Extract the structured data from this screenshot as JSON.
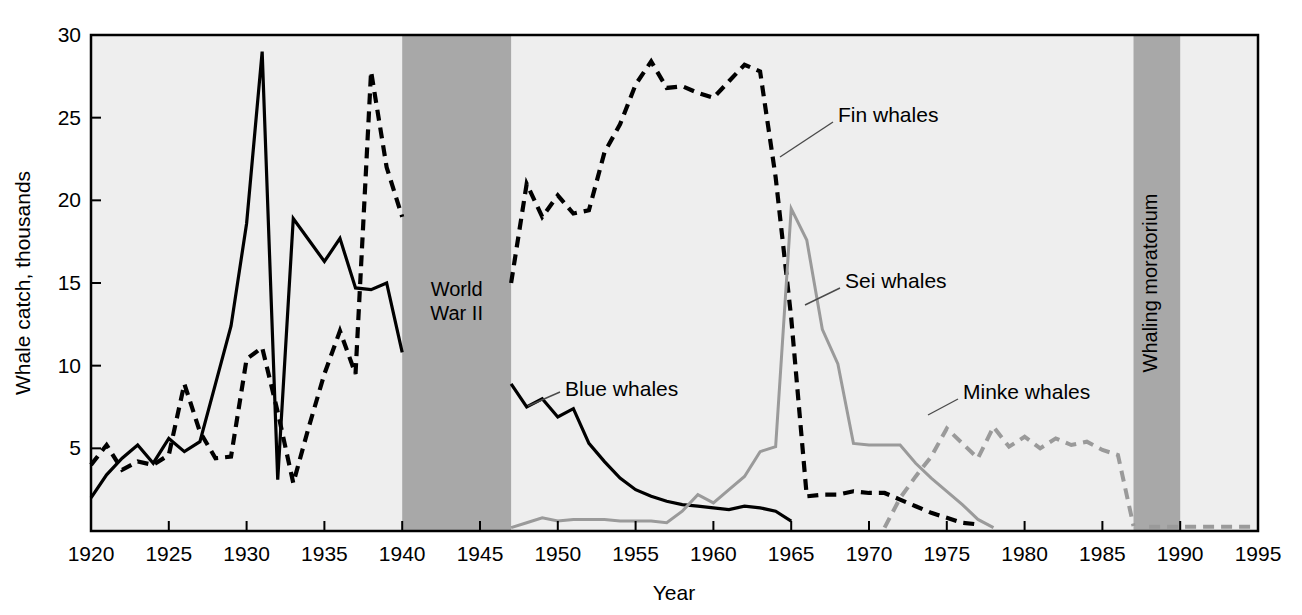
{
  "chart_data": {
    "type": "line",
    "title": "",
    "xlabel": "Year",
    "ylabel": "Whale catch, thousands",
    "xlim": [
      1920,
      1995
    ],
    "ylim": [
      0,
      30
    ],
    "grid": false,
    "legend_position": "inline-annotations",
    "xticks": [
      1920,
      1925,
      1930,
      1935,
      1940,
      1945,
      1950,
      1955,
      1960,
      1965,
      1970,
      1975,
      1980,
      1985,
      1990,
      1995
    ],
    "xtick_labels": [
      "1920",
      "1925",
      "1930",
      "1935",
      "1940",
      "1945",
      "1950",
      "1955",
      "1960",
      "1965",
      "1970",
      "1975",
      "1980",
      "1985",
      "1990",
      "1995"
    ],
    "yticks": [
      5,
      10,
      15,
      20,
      25,
      30
    ],
    "ytick_labels": [
      "5",
      "10",
      "15",
      "20",
      "25",
      "30"
    ],
    "plot_background": "#eeeeee",
    "bands": [
      {
        "name": "world-war-ii",
        "label": "World\nWar II",
        "label_line1": "World",
        "label_line2": "War II",
        "x_start": 1940,
        "x_end": 1947,
        "color": "#a8a8a8",
        "orientation": "horizontal-text"
      },
      {
        "name": "whaling-moratorium",
        "label": "Whaling moratorium",
        "x_start": 1987,
        "x_end": 1990,
        "color": "#a8a8a8",
        "orientation": "vertical-text"
      }
    ],
    "series": [
      {
        "name": "Blue whales",
        "label": "Blue whales",
        "color": "#000000",
        "style": "solid",
        "width": 3.2,
        "label_x": 565,
        "label_y": 396,
        "leader": [
          [
            560,
            392
          ],
          [
            528,
            406
          ]
        ],
        "segments": [
          {
            "x": [
              1920,
              1921,
              1922,
              1923,
              1924,
              1925,
              1926,
              1927,
              1928,
              1929,
              1930,
              1931,
              1932,
              1933,
              1934,
              1935,
              1936,
              1937,
              1938,
              1939,
              1940
            ],
            "y": [
              2.0,
              3.4,
              4.4,
              5.2,
              4.1,
              5.6,
              4.8,
              5.4,
              8.9,
              12.4,
              18.6,
              29.0,
              3.1,
              18.9,
              17.6,
              16.3,
              17.7,
              14.7,
              14.6,
              15.0,
              10.8
            ]
          },
          {
            "x": [
              1947,
              1948,
              1949,
              1950,
              1951,
              1952,
              1953,
              1954,
              1955,
              1956,
              1957,
              1958,
              1959,
              1960,
              1961,
              1962,
              1963,
              1964,
              1965
            ],
            "y": [
              8.9,
              7.5,
              8.0,
              6.9,
              7.4,
              5.3,
              4.2,
              3.2,
              2.5,
              2.1,
              1.8,
              1.6,
              1.5,
              1.4,
              1.3,
              1.5,
              1.4,
              1.2,
              0.6
            ]
          }
        ]
      },
      {
        "name": "Fin whales",
        "label": "Fin whales",
        "color": "#000000",
        "style": "dashed",
        "width": 4.2,
        "label_x": 838,
        "label_y": 122,
        "leader": [
          [
            833,
            122
          ],
          [
            780,
            157
          ]
        ],
        "segments": [
          {
            "x": [
              1920,
              1921,
              1922,
              1923,
              1924,
              1925,
              1926,
              1927,
              1928,
              1929,
              1930,
              1931,
              1932,
              1933,
              1934,
              1935,
              1936,
              1937,
              1938,
              1939,
              1940
            ],
            "y": [
              4.0,
              5.2,
              3.7,
              4.2,
              4.0,
              4.6,
              8.9,
              6.0,
              4.4,
              4.5,
              10.4,
              11.1,
              7.2,
              2.9,
              6.3,
              9.5,
              12.1,
              9.5,
              27.8,
              22.0,
              19.0
            ]
          },
          {
            "x": [
              1947,
              1948,
              1949,
              1950,
              1951,
              1952,
              1953,
              1954,
              1955,
              1956,
              1957,
              1958,
              1959,
              1960,
              1961,
              1962,
              1963,
              1964,
              1965,
              1966,
              1967,
              1968,
              1969,
              1970,
              1971,
              1972,
              1973,
              1974,
              1975,
              1976,
              1977
            ],
            "y": [
              15.0,
              21.0,
              19.0,
              20.3,
              19.2,
              19.4,
              22.9,
              24.6,
              27.0,
              28.4,
              26.8,
              26.9,
              26.5,
              26.2,
              27.2,
              28.2,
              27.8,
              21.4,
              12.9,
              2.1,
              2.2,
              2.2,
              2.4,
              2.3,
              2.3,
              1.9,
              1.5,
              1.1,
              0.8,
              0.5,
              0.4
            ]
          }
        ]
      },
      {
        "name": "Sei whales",
        "label": "Sei whales",
        "color": "#9a9a9a",
        "style": "solid",
        "width": 3.0,
        "label_x": 845,
        "label_y": 288,
        "leader": [
          [
            840,
            288
          ],
          [
            805,
            305
          ]
        ],
        "segments": [
          {
            "x": [
              1947,
              1948,
              1949,
              1950,
              1951,
              1952,
              1953,
              1954,
              1955,
              1956,
              1957,
              1958,
              1959,
              1960,
              1961,
              1962,
              1963,
              1964,
              1965,
              1966,
              1967,
              1968,
              1969,
              1970,
              1971,
              1972,
              1973,
              1974,
              1975,
              1976,
              1977,
              1978
            ],
            "y": [
              0.2,
              0.5,
              0.8,
              0.6,
              0.7,
              0.7,
              0.7,
              0.6,
              0.6,
              0.6,
              0.5,
              1.2,
              2.2,
              1.7,
              2.5,
              3.3,
              4.8,
              5.1,
              19.5,
              17.6,
              12.2,
              10.1,
              5.3,
              5.2,
              5.2,
              5.2,
              4.1,
              3.2,
              2.4,
              1.6,
              0.7,
              0.2
            ]
          }
        ]
      },
      {
        "name": "Minke whales",
        "label": "Minke whales",
        "color": "#9a9a9a",
        "style": "dashed",
        "width": 4.0,
        "label_x": 963,
        "label_y": 399,
        "leader": [
          [
            958,
            399
          ],
          [
            928,
            415
          ]
        ],
        "segments": [
          {
            "x": [
              1971,
              1972,
              1973,
              1974,
              1975,
              1976,
              1977,
              1978,
              1979,
              1980,
              1981,
              1982,
              1983,
              1984,
              1985,
              1986,
              1987
            ],
            "y": [
              0.2,
              2.0,
              3.3,
              4.5,
              6.2,
              5.3,
              4.4,
              6.3,
              5.1,
              5.7,
              5.0,
              5.6,
              5.2,
              5.4,
              4.9,
              4.6,
              0.3
            ]
          },
          {
            "x": [
              1988,
              1989,
              1990,
              1991,
              1992,
              1993,
              1994,
              1995
            ],
            "y": [
              0.25,
              0.25,
              0.25,
              0.25,
              0.25,
              0.25,
              0.25,
              0.25
            ]
          }
        ]
      }
    ]
  },
  "axes": {
    "y_title": "Whale catch, thousands",
    "x_title": "Year"
  }
}
